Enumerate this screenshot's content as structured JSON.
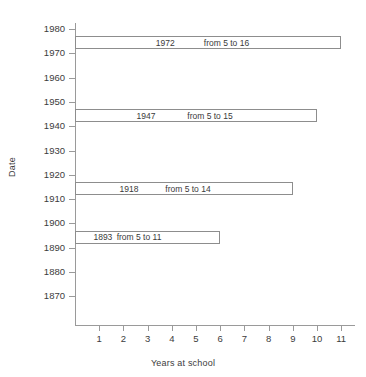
{
  "chart_data": {
    "type": "bar",
    "orientation": "horizontal",
    "title": "",
    "xlabel": "Years at school",
    "ylabel": "Date",
    "xlim": [
      0,
      11.6
    ],
    "ylim": [
      1865,
      1984
    ],
    "grid": false,
    "legend": null,
    "xticks": [
      "1",
      "2",
      "3",
      "4",
      "5",
      "6",
      "7",
      "8",
      "9",
      "10",
      "11"
    ],
    "xtick_values": [
      1,
      2,
      3,
      4,
      5,
      6,
      7,
      8,
      9,
      10,
      11
    ],
    "yticks": [
      "1870",
      "1880",
      "1890",
      "1900",
      "1910",
      "1920",
      "1930",
      "1940",
      "1950",
      "1960",
      "1970",
      "1980"
    ],
    "ytick_values": [
      1870,
      1880,
      1890,
      1900,
      1910,
      1920,
      1930,
      1940,
      1950,
      1960,
      1970,
      1980
    ],
    "bars": [
      {
        "year": "1972",
        "range": "from 5 to 16",
        "year_value": 1972,
        "age_from": 5,
        "age_to": 16,
        "value": 11,
        "y_top": 1977,
        "y_bottom": 1972
      },
      {
        "year": "1947",
        "range": "from 5 to 15",
        "year_value": 1947,
        "age_from": 5,
        "age_to": 15,
        "value": 10,
        "y_top": 1947,
        "y_bottom": 1942
      },
      {
        "year": "1918",
        "range": "from 5 to 14",
        "year_value": 1918,
        "age_from": 5,
        "age_to": 14,
        "value": 9,
        "y_top": 1917,
        "y_bottom": 1912
      },
      {
        "year": "1893",
        "range": "from 5 to 11",
        "year_value": 1893,
        "age_from": 5,
        "age_to": 11,
        "value": 6,
        "y_top": 1897,
        "y_bottom": 1892
      }
    ],
    "colors": {
      "bar_fill": "#ffffff",
      "bar_stroke": "#8d8d8d",
      "axis": "#9a9a9a",
      "text": "#3a3a3a",
      "background": "#ffffff"
    }
  }
}
